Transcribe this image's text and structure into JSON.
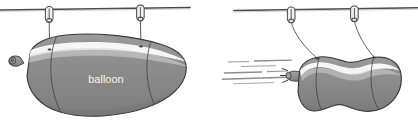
{
  "figure": {
    "background_color": "#ffffff",
    "width": 418,
    "height": 121
  },
  "palette": {
    "balloon_fill": "#8a8a8a",
    "balloon_fill_dark": "#7b7b7b",
    "balloon_fill_light": "#9a9a9a",
    "balloon_highlight": "#fbfbfb",
    "outline": "#3b3b3b",
    "rod": "#4a4a4a",
    "string": "#555555",
    "clip": "#6e6e6e",
    "airstream": "#8d8d8d",
    "label_text": "#f4f4f4"
  },
  "panels": [
    {
      "id": "panel-left",
      "name": "balloon-at-rest",
      "caption": "",
      "rod": {
        "name": "support-rod",
        "label": "rod"
      },
      "clips": [
        {
          "name": "clip-left",
          "label": "clip"
        },
        {
          "name": "clip-right",
          "label": "clip"
        }
      ],
      "strings": [
        {
          "name": "string-left",
          "label": "string",
          "state": "vertical"
        },
        {
          "name": "string-right",
          "label": "string",
          "state": "vertical"
        }
      ],
      "balloon": {
        "name": "balloon-inflated",
        "label": "balloon",
        "shape": "sausage",
        "nozzle": {
          "name": "balloon-nozzle-closed",
          "label": "nozzle",
          "state": "closed"
        },
        "highlight": "specular-band",
        "seams": 2
      },
      "airstream": {
        "visible": false,
        "streak_count": 0
      }
    },
    {
      "id": "panel-right",
      "name": "balloon-releasing-air",
      "caption": "",
      "rod": {
        "name": "support-rod",
        "label": "rod"
      },
      "clips": [
        {
          "name": "clip-left",
          "label": "clip"
        },
        {
          "name": "clip-right",
          "label": "clip"
        }
      ],
      "strings": [
        {
          "name": "string-left",
          "label": "string",
          "state": "tilted"
        },
        {
          "name": "string-right",
          "label": "string",
          "state": "tilted"
        }
      ],
      "balloon": {
        "name": "balloon-deflating",
        "label": "",
        "shape": "lobed-peanut",
        "nozzle": {
          "name": "balloon-nozzle-open",
          "label": "nozzle",
          "state": "open"
        },
        "highlight": "specular-band",
        "seams": 2
      },
      "airstream": {
        "name": "escaping-air",
        "label": "escaping air",
        "visible": true,
        "streak_count": 6,
        "direction": "left"
      }
    }
  ]
}
